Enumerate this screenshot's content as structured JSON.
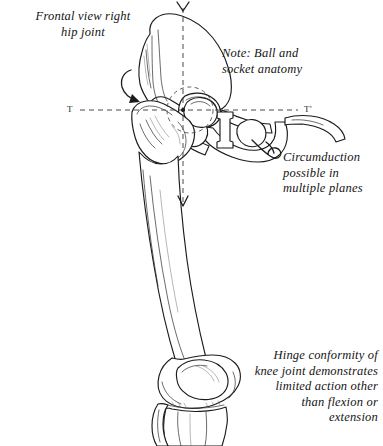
{
  "figure": {
    "title": "Frontal view right hip joint",
    "background_color": "#ffffff",
    "ink_color": "#1b1b1b"
  },
  "captions": {
    "title": "Frontal view right\nhip joint",
    "note_ball_socket": "Note: Ball and\nsocket anatomy",
    "note_circumduction": "Circumduction\npossible in\nmultiple planes",
    "note_hinge": "Hinge conformity of\nknee joint demonstrates\nlimited action other\nthan flexion or\nextension"
  },
  "axes": {
    "transverse_label_left": "T",
    "transverse_label_right": "T'",
    "vertical_axis_name": "vertical rotation axis",
    "transverse_axis_name": "transverse axis T-T'"
  },
  "structures": [
    {
      "name": "ilium",
      "label": "ilium"
    },
    {
      "name": "femoral-head",
      "label": "femoral head (ball)"
    },
    {
      "name": "acetabulum",
      "label": "acetabulum (socket)"
    },
    {
      "name": "greater-trochanter",
      "label": "greater trochanter"
    },
    {
      "name": "femoral-shaft",
      "label": "femoral shaft"
    },
    {
      "name": "pubis",
      "label": "pubis"
    },
    {
      "name": "obturator-foramen-left",
      "label": "obturator foramen"
    },
    {
      "name": "obturator-foramen-right",
      "label": "obturator foramen"
    },
    {
      "name": "distal-femur",
      "label": "distal femur condyles"
    },
    {
      "name": "patella",
      "label": "patella"
    },
    {
      "name": "tibia",
      "label": "tibia"
    },
    {
      "name": "fibula",
      "label": "fibula"
    }
  ],
  "arrows": [
    {
      "name": "rotation-arrow-hip",
      "label": "rotation arrow at hip"
    },
    {
      "name": "circumduction-arrow",
      "label": "circumduction pointer"
    },
    {
      "name": "axis-arrow-top",
      "label": "vertical axis top arrowhead"
    },
    {
      "name": "axis-arrow-bottom",
      "label": "vertical axis bottom arrowhead"
    }
  ]
}
